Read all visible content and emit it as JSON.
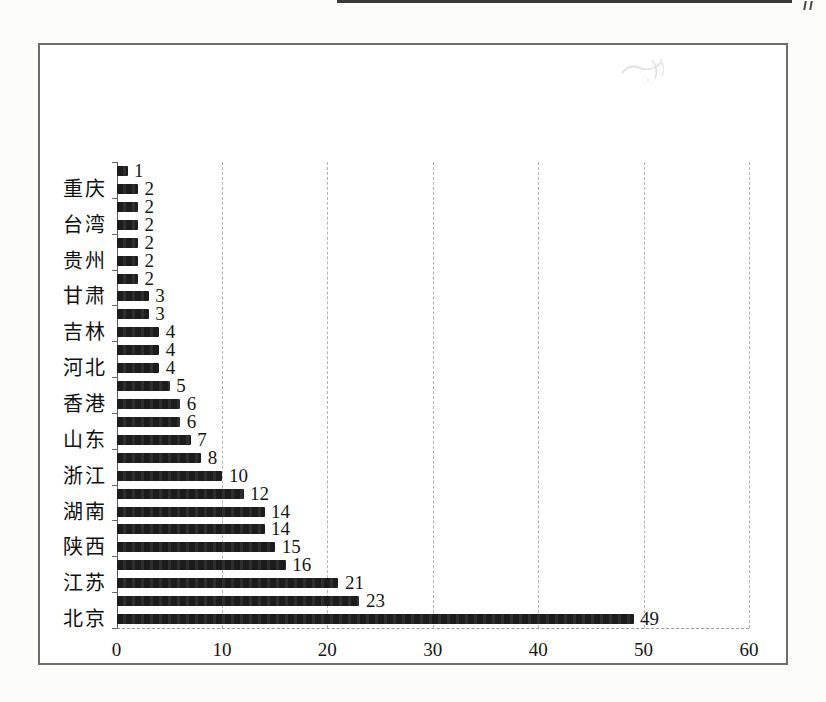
{
  "page": {
    "corner_mark": "〃",
    "background": "#fcfcfb",
    "top_rule_color": "#3a3a3a"
  },
  "chart": {
    "frame_border_color": "#6d6d6d",
    "background": "#ffffff",
    "gridline_color": "#b4b4b4",
    "axis_color": "#5a5a5a",
    "text_color": "#111111"
  },
  "chart_data": {
    "type": "bar",
    "orientation": "horizontal",
    "title": "",
    "xlabel": "",
    "ylabel": "",
    "xlim": [
      0,
      60
    ],
    "xticks": [
      "0",
      "10",
      "20",
      "30",
      "40",
      "50",
      "60"
    ],
    "grid": "vertical dashed gridlines at each x tick; dashed baseline; no legend",
    "legend": "none",
    "bar_color": "#1c1c1c",
    "category_label_interval": 2,
    "rows_top_to_bottom": [
      {
        "label": "",
        "value": 1
      },
      {
        "label": "重庆",
        "value": 2
      },
      {
        "label": "",
        "value": 2
      },
      {
        "label": "台湾",
        "value": 2
      },
      {
        "label": "",
        "value": 2
      },
      {
        "label": "贵州",
        "value": 2
      },
      {
        "label": "",
        "value": 2
      },
      {
        "label": "甘肃",
        "value": 3
      },
      {
        "label": "",
        "value": 3
      },
      {
        "label": "吉林",
        "value": 4
      },
      {
        "label": "",
        "value": 4
      },
      {
        "label": "河北",
        "value": 4
      },
      {
        "label": "",
        "value": 5
      },
      {
        "label": "香港",
        "value": 6
      },
      {
        "label": "",
        "value": 6
      },
      {
        "label": "山东",
        "value": 7
      },
      {
        "label": "",
        "value": 8
      },
      {
        "label": "浙江",
        "value": 10
      },
      {
        "label": "",
        "value": 12
      },
      {
        "label": "湖南",
        "value": 14
      },
      {
        "label": "",
        "value": 14
      },
      {
        "label": "陕西",
        "value": 15
      },
      {
        "label": "",
        "value": 16
      },
      {
        "label": "江苏",
        "value": 21
      },
      {
        "label": "",
        "value": 23
      },
      {
        "label": "北京",
        "value": 49
      }
    ]
  }
}
